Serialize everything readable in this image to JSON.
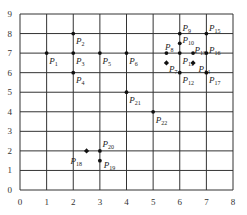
{
  "chart_data": {
    "type": "scatter",
    "title": "",
    "xlabel": "",
    "ylabel": "",
    "xlim": [
      0,
      8
    ],
    "ylim": [
      0,
      9
    ],
    "grid": true,
    "x_ticks": [
      "0",
      "1",
      "2",
      "3",
      "4",
      "5",
      "6",
      "7",
      "8"
    ],
    "y_ticks": [
      "0",
      "1",
      "2",
      "3",
      "4",
      "5",
      "6",
      "7",
      "8",
      "9"
    ],
    "points": [
      {
        "name": "P1",
        "x": 1,
        "y": 7,
        "marker": "dot",
        "label_dx": 0.1,
        "label_dy": -0.4
      },
      {
        "name": "P2",
        "x": 2,
        "y": 8,
        "marker": "dot",
        "label_dx": 0.1,
        "label_dy": -0.4
      },
      {
        "name": "P3",
        "x": 2,
        "y": 7,
        "marker": "dot",
        "label_dx": 0.1,
        "label_dy": -0.4
      },
      {
        "name": "P4",
        "x": 2,
        "y": 6,
        "marker": "dot",
        "label_dx": 0.1,
        "label_dy": -0.4
      },
      {
        "name": "P5",
        "x": 3,
        "y": 7,
        "marker": "dot",
        "label_dx": 0.1,
        "label_dy": -0.4
      },
      {
        "name": "P6",
        "x": 4,
        "y": 7,
        "marker": "dot",
        "label_dx": 0.1,
        "label_dy": -0.4
      },
      {
        "name": "P7",
        "x": 5.5,
        "y": 6.5,
        "marker": "diamond",
        "label_dx": 0.1,
        "label_dy": -0.3
      },
      {
        "name": "P8",
        "x": 5.5,
        "y": 7,
        "marker": "dot",
        "label_dx": -0.05,
        "label_dy": 0.3
      },
      {
        "name": "P9",
        "x": 6,
        "y": 8,
        "marker": "dot",
        "label_dx": 0.1,
        "label_dy": 0.3
      },
      {
        "name": "P10",
        "x": 6,
        "y": 7.5,
        "marker": "dot",
        "label_dx": 0.1,
        "label_dy": 0.15
      },
      {
        "name": "P11",
        "x": 6,
        "y": 7,
        "marker": "dot",
        "label_dx": 0.1,
        "label_dy": -0.4
      },
      {
        "name": "P12",
        "x": 6,
        "y": 6,
        "marker": "dot",
        "label_dx": 0.1,
        "label_dy": -0.4
      },
      {
        "name": "P13",
        "x": 6.5,
        "y": 7,
        "marker": "dot",
        "label_dx": 0.05,
        "label_dy": 0.15
      },
      {
        "name": "P14",
        "x": 6.5,
        "y": 6.5,
        "marker": "diamond",
        "label_dx": 0.2,
        "label_dy": -0.3
      },
      {
        "name": "P15",
        "x": 7,
        "y": 8,
        "marker": "dot",
        "label_dx": 0.1,
        "label_dy": 0.3
      },
      {
        "name": "P16",
        "x": 7,
        "y": 7,
        "marker": "dot",
        "label_dx": 0.1,
        "label_dy": 0.15
      },
      {
        "name": "P17",
        "x": 7,
        "y": 6,
        "marker": "dot",
        "label_dx": 0.1,
        "label_dy": -0.4
      },
      {
        "name": "P18",
        "x": 2.5,
        "y": 2,
        "marker": "diamond",
        "label_dx": -0.6,
        "label_dy": -0.5
      },
      {
        "name": "P19",
        "x": 3,
        "y": 1.5,
        "marker": "dot",
        "label_dx": 0.15,
        "label_dy": -0.2
      },
      {
        "name": "P20",
        "x": 3,
        "y": 2,
        "marker": "dot",
        "label_dx": 0.1,
        "label_dy": 0.35
      },
      {
        "name": "P21",
        "x": 4,
        "y": 5,
        "marker": "dot",
        "label_dx": 0.1,
        "label_dy": -0.4
      },
      {
        "name": "P22",
        "x": 5,
        "y": 4,
        "marker": "dot",
        "label_dx": 0.1,
        "label_dy": -0.4
      }
    ],
    "colors": {
      "grid": "#333333",
      "point": "#111111",
      "text": "#222222"
    }
  }
}
